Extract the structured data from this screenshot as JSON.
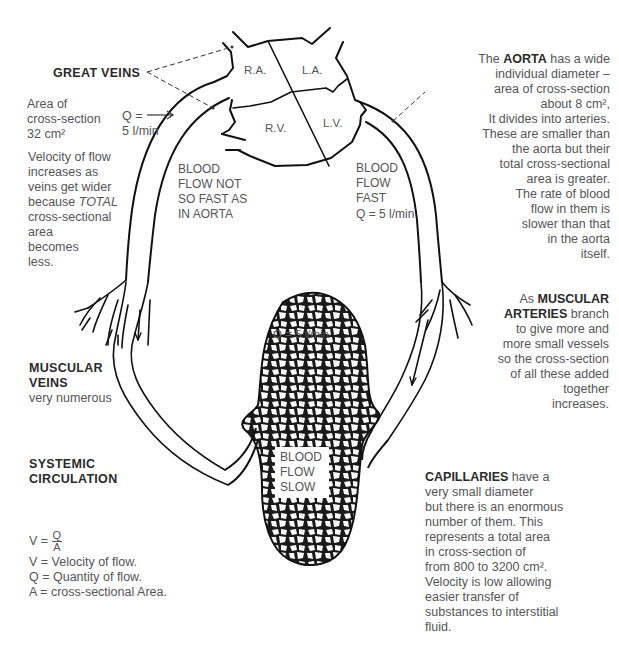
{
  "heart": {
    "chambers": [
      "R.A.",
      "L.A.",
      "R.V.",
      "L.V."
    ]
  },
  "labels": {
    "great_veins": "GREAT VEINS",
    "veins_area": [
      "Area of",
      "cross-section",
      "32 cm²"
    ],
    "q_in": [
      "Q =",
      "5 l/min"
    ],
    "veins_velocity": [
      "Velocity of flow",
      "increases as",
      "veins get wider",
      "because ",
      "TOTAL",
      "cross-sectional",
      "area",
      "becomes",
      "less."
    ],
    "blood_flow_not_fast": [
      "BLOOD",
      "FLOW NOT",
      "SO FAST AS",
      "IN AORTA"
    ],
    "blood_flow_fast": [
      "BLOOD",
      "FLOW",
      "FAST",
      "Q = 5 l/min"
    ],
    "aorta": {
      "prefix": "The ",
      "bold": "AORTA",
      "suffix": " has a wide",
      "lines": [
        "individual diameter –",
        "area of cross-section",
        "about 8 cm²,",
        "It divides into arteries.",
        "These are smaller than",
        "the aorta but their",
        "total cross-sectional",
        "area is greater.",
        "The rate of blood",
        "flow in them is",
        "slower than that",
        "in the aorta",
        "itself."
      ]
    },
    "muscular_arteries": {
      "prefix": "As ",
      "bold1": "MUSCULAR",
      "bold2": "ARTERIES",
      "suffix": " branch",
      "lines": [
        "to give more and",
        "more small vessels",
        "so the cross-section",
        "of all these added",
        "together",
        "increases."
      ]
    },
    "q_capillaries": "Q = 5 l/min",
    "blood_flow_slow": [
      "BLOOD",
      "FLOW",
      "SLOW"
    ],
    "muscular_veins": {
      "title": [
        "MUSCULAR",
        "VEINS"
      ],
      "sub": "very numerous"
    },
    "systemic": [
      "SYSTEMIC",
      "CIRCULATION"
    ],
    "formula": {
      "lhs": "V =",
      "num": "Q",
      "den": "A",
      "defs": [
        "V = Velocity of flow.",
        "Q = Quantity of flow.",
        "A = cross-sectional Area."
      ]
    },
    "capillaries": {
      "bold": "CAPILLARIES",
      "suffix": " have a",
      "lines": [
        "very small diameter",
        "but there is an enormous",
        "number of them. This",
        "represents a total area",
        "in cross-section of",
        "from 800 to 3200 cm².",
        "Velocity is low allowing",
        "easier transfer of",
        "substances to interstitial",
        "fluid."
      ]
    }
  }
}
